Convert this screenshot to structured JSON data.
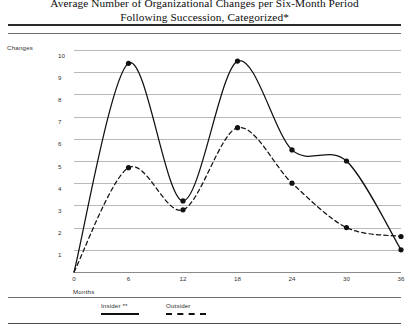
{
  "title": {
    "line1": "Average Number of Organizational Changes per Six-Month Period",
    "line2": "Following Succession, Categorized*"
  },
  "axis": {
    "y_caption": "Changes",
    "x_caption": "Months"
  },
  "legend": {
    "insider_label": "Insider **",
    "outsider_label": "Outsider"
  },
  "chart_data": {
    "type": "line",
    "title": "Average Number of Organizational Changes per Six-Month Period Following Succession, Categorized*",
    "xlabel": "Months",
    "ylabel": "Changes",
    "x": [
      0,
      6,
      12,
      18,
      24,
      30,
      36
    ],
    "xticklabels": [
      "0",
      "6",
      "12",
      "18",
      "24",
      "30",
      "36"
    ],
    "yticklabels": [
      "1",
      "2",
      "3",
      "4",
      "5",
      "6",
      "7",
      "8",
      "9",
      "10"
    ],
    "xlim": [
      0,
      36
    ],
    "ylim": [
      0,
      10
    ],
    "grid": true,
    "legend_position": "below-axis-left",
    "series": [
      {
        "name": "Insider **",
        "style": "solid",
        "color": "#111111",
        "markers": true,
        "values": [
          0,
          9.4,
          3.2,
          9.5,
          5.5,
          5.0,
          1.0
        ]
      },
      {
        "name": "Outsider",
        "style": "dashed",
        "color": "#111111",
        "markers": true,
        "values": [
          0,
          4.7,
          2.8,
          6.5,
          4.0,
          2.0,
          1.6
        ]
      }
    ]
  }
}
